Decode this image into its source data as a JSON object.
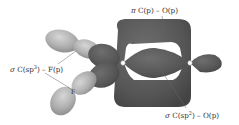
{
  "diagram": {
    "type": "molecular-orbital-surfaces",
    "colors": {
      "background": "#ffffff",
      "dark_lobe": "#5a5a5a",
      "dark_lobe_shade": "#4a4a4a",
      "light_lobe": "#b8b8b8",
      "light_lobe_shade": "#9a9a9a",
      "label_text": "#333333",
      "leader_line": "#666666",
      "nucleus": "#ffffff"
    },
    "labels": {
      "pi_bond": {
        "prefix": "π",
        "text": "C(p) – O(p)"
      },
      "sigma_cf": {
        "prefix": "σ",
        "text_before_sup": "C(sp",
        "sup": "3",
        "text_after_sup": ") – F(p)"
      },
      "sigma_co": {
        "prefix": "σ",
        "text_before_sup": "C(sp",
        "sup": "2",
        "text_after_sup": ") – O(p)"
      },
      "atom_f": "F"
    }
  }
}
